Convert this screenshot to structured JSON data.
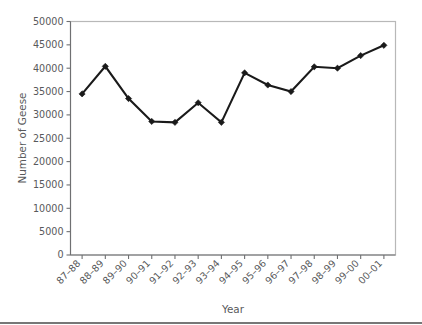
{
  "chart_data": {
    "type": "line",
    "title": "",
    "subtitle": "",
    "xlabel": "Year",
    "ylabel": "Number of Geese",
    "categories": [
      "87–88",
      "88–89",
      "89–90",
      "90–91",
      "91–92",
      "92–93",
      "93–94",
      "94–95",
      "95–96",
      "96–97",
      "97–98",
      "98–99",
      "99–00",
      "00–01"
    ],
    "values": [
      34500,
      40400,
      33500,
      28600,
      28400,
      32600,
      28400,
      39000,
      36400,
      35000,
      40300,
      40000,
      42700,
      44900
    ],
    "series": [
      {
        "name": "Number of Geese",
        "values": [
          34500,
          40400,
          33500,
          28600,
          28400,
          32600,
          28400,
          39000,
          36400,
          35000,
          40300,
          40000,
          42700,
          44900
        ]
      }
    ],
    "ylim": [
      0,
      50000
    ],
    "ytick_values": [
      0,
      5000,
      10000,
      15000,
      20000,
      25000,
      30000,
      35000,
      40000,
      45000,
      50000
    ],
    "ytick_labels": [
      "0",
      "5000",
      "10000",
      "15000",
      "20000",
      "25000",
      "30000",
      "35000",
      "40000",
      "45000",
      "50000"
    ],
    "grid": false,
    "legend": false,
    "legend_position": "none",
    "marker": "diamond",
    "line_color": "#1a1a1a",
    "marker_color": "#1a1a1a",
    "text_color": "#58595b",
    "plot_border_color": "#b8b8b8",
    "background_color": "#ffffff",
    "xtick_label_rotation": -45,
    "annotations": []
  },
  "axes": {
    "y_title": "Number of Geese",
    "x_title": "Year"
  }
}
